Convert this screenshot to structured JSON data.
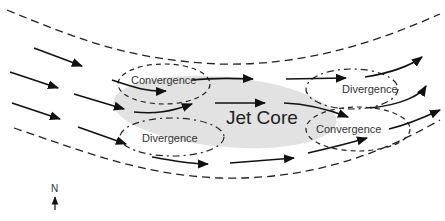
{
  "diagram": {
    "core_label": "Jet Core",
    "zones": [
      {
        "id": "entrance-left",
        "label": "Convergence"
      },
      {
        "id": "entrance-right",
        "label": "Divergence"
      },
      {
        "id": "exit-left",
        "label": "Divergence"
      },
      {
        "id": "exit-right",
        "label": "Convergence"
      }
    ],
    "north_label": "N",
    "colors": {
      "core_fill": "#e2e2e2",
      "arrow": "#111111",
      "dashed": "#222222",
      "text": "#333333"
    }
  }
}
